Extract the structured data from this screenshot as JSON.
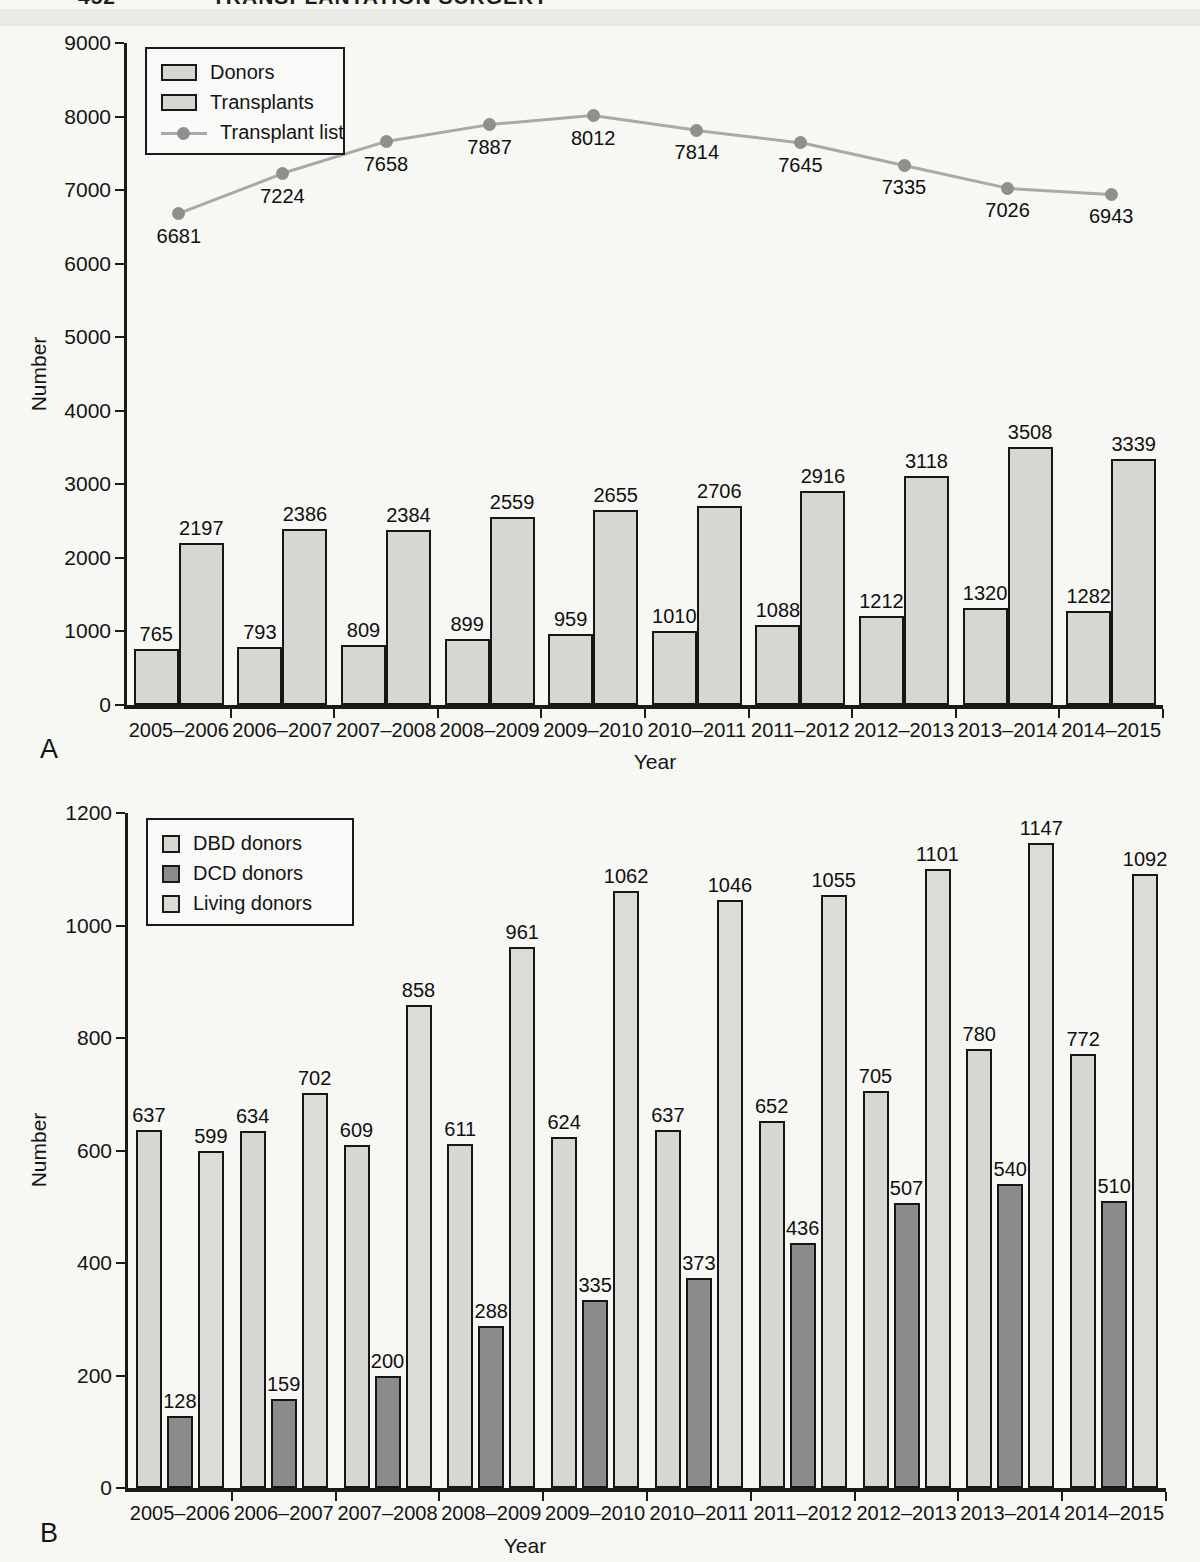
{
  "page": {
    "header_page_number": "452",
    "header_title": "TRANSPLANTATION SURGERY"
  },
  "colors": {
    "bar_light": "#d6d6d3",
    "bar_living": "#dbdbd8",
    "bar_dark": "#8b8b8b",
    "line": "#a9a9a7",
    "marker": "#8f8f8d",
    "axis": "#1a1a1a",
    "text": "#141414",
    "paper": "#f7f7f4"
  },
  "chart_data": [
    {
      "id": "A",
      "panel_label": "A",
      "type": "bar+line",
      "title": "",
      "xlabel": "Year",
      "ylabel": "Number",
      "ylim": [
        0,
        9000
      ],
      "ytick_step": 1000,
      "yticks": [
        0,
        1000,
        2000,
        3000,
        4000,
        5000,
        6000,
        7000,
        8000,
        9000
      ],
      "grid": false,
      "legend_position": "top-left",
      "categories": [
        "2005–2006",
        "2006–2007",
        "2007–2008",
        "2008–2009",
        "2009–2010",
        "2010–2011",
        "2011–2012",
        "2012–2013",
        "2013–2014",
        "2014–2015"
      ],
      "series": [
        {
          "name": "Donors",
          "type": "bar",
          "swatch": "rect",
          "color_key": "bar_light",
          "values": [
            765,
            793,
            809,
            899,
            959,
            1010,
            1088,
            1212,
            1320,
            1282
          ]
        },
        {
          "name": "Transplants",
          "type": "bar",
          "swatch": "rect",
          "color_key": "bar_light",
          "values": [
            2197,
            2386,
            2384,
            2559,
            2655,
            2706,
            2916,
            3118,
            3508,
            3339
          ]
        },
        {
          "name": "Transplant list",
          "type": "line",
          "swatch": "line-marker",
          "color_key": "line",
          "values": [
            6681,
            7224,
            7658,
            7887,
            8012,
            7814,
            7645,
            7335,
            7026,
            6943
          ]
        }
      ]
    },
    {
      "id": "B",
      "panel_label": "B",
      "type": "bar",
      "title": "",
      "xlabel": "Year",
      "ylabel": "Number",
      "ylim": [
        0,
        1200
      ],
      "ytick_step": 200,
      "yticks": [
        0,
        200,
        400,
        600,
        800,
        1000,
        1200
      ],
      "grid": false,
      "legend_position": "top-left",
      "categories": [
        "2005–2006",
        "2006–2007",
        "2007–2008",
        "2008–2009",
        "2009–2010",
        "2010–2011",
        "2011–2012",
        "2012–2013",
        "2013–2014",
        "2014–2015"
      ],
      "series": [
        {
          "name": "DBD donors",
          "type": "bar",
          "swatch": "square",
          "color_key": "bar_light",
          "values": [
            637,
            634,
            609,
            611,
            624,
            637,
            652,
            705,
            780,
            772
          ]
        },
        {
          "name": "DCD donors",
          "type": "bar",
          "swatch": "square",
          "color_key": "bar_dark",
          "values": [
            128,
            159,
            200,
            288,
            335,
            373,
            436,
            507,
            540,
            510
          ]
        },
        {
          "name": "Living donors",
          "type": "bar",
          "swatch": "square",
          "color_key": "bar_living",
          "values": [
            599,
            702,
            858,
            961,
            1062,
            1046,
            1055,
            1101,
            1147,
            1092
          ]
        }
      ]
    }
  ]
}
